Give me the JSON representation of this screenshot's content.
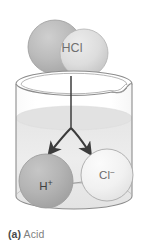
{
  "figure": {
    "type": "science-diagram",
    "caption_tag": "(a)",
    "caption_text": " Acid",
    "background_color": "#ffffff"
  },
  "molecule": {
    "name": "molecule-hcl",
    "label": "HCl",
    "label_color": "#6f6f6f",
    "atom_left": {
      "name": "hydrogen-atom-sphere",
      "fill": "#b9b9b9",
      "stroke": "#9a9a9a"
    },
    "atom_right": {
      "name": "chlorine-atom-sphere",
      "fill": "#dedede",
      "stroke": "#b0b0b0"
    }
  },
  "beaker": {
    "name": "glass-beaker",
    "stroke": "#8d8d8d",
    "glass_fill": "#fdfdfd",
    "liquid_fill": "#ebebeb",
    "liquid_surface_fill": "#e2e2e2",
    "has_spout": true,
    "spout_side": "right"
  },
  "dissociation": {
    "name": "dissociation-arrows",
    "arrow_color": "#3c3c3c",
    "stem_label": "",
    "branches": [
      {
        "name": "arrow-to-hydrogen-ion",
        "direction": "down-left",
        "target": "H+"
      },
      {
        "name": "arrow-to-chloride-ion",
        "direction": "down-right",
        "target": "Cl-"
      }
    ]
  },
  "ions": [
    {
      "name": "hydrogen-ion",
      "label": "H",
      "charge": "+",
      "label_color": "#3f3f3f",
      "fill": "#b2b2b2",
      "stroke": "#9d9d9d"
    },
    {
      "name": "chloride-ion",
      "label": "Cl",
      "charge": "−",
      "label_color": "#6b6b6b",
      "fill": "#f2f2f2",
      "stroke": "#a9a9a9"
    }
  ]
}
